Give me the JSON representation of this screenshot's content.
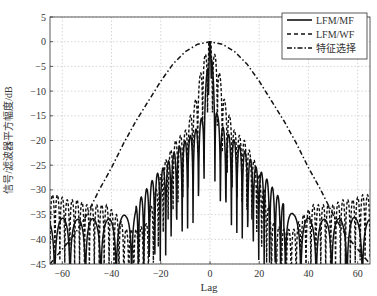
{
  "chart_data": {
    "type": "line",
    "title": "",
    "xlabel": "Lag",
    "ylabel": "信号/滤波器平方幅度/dB",
    "xlim": [
      -65,
      65
    ],
    "ylim": [
      -45,
      5
    ],
    "xticks": [
      -60,
      -40,
      -20,
      0,
      20,
      40,
      60
    ],
    "yticks": [
      5,
      0,
      -5,
      -10,
      -15,
      -20,
      -25,
      -30,
      -35,
      -40,
      -45
    ],
    "grid": true,
    "legend_position": "upper right",
    "series": [
      {
        "name": "LFM/MF",
        "style": "solid",
        "description": "Matched-filter output: 0 dB mainlobe at lag 0, near-in sidelobes about -13 to -20 dB, far sidelobes oscillating between about -35 and -45 dB",
        "x": [
          -62,
          -58,
          -54,
          -50,
          -46,
          -42,
          -38,
          -34,
          -30,
          -26,
          -22,
          -18,
          -14,
          -10,
          -6,
          -3,
          0,
          3,
          6,
          10,
          14,
          18,
          22,
          26,
          30,
          34,
          38,
          42,
          46,
          50,
          54,
          58,
          62
        ],
        "values": [
          -36,
          -35.5,
          -36,
          -35.5,
          -36,
          -36,
          -35.5,
          -35,
          -33,
          -30,
          -27,
          -25,
          -22,
          -20,
          -18,
          -15,
          0,
          -15,
          -18,
          -20,
          -22,
          -25,
          -27,
          -30,
          -33,
          -35,
          -35.5,
          -36,
          -36,
          -35.5,
          -36,
          -35.5,
          -36
        ]
      },
      {
        "name": "LFM/WF",
        "style": "dashed",
        "description": "Weighted-filter output: 0 dB peak at lag 0, dense sidelobes about -3 to -20 dB near center, far sidelobes about -30 to -38 dB",
        "x": [
          -62,
          -58,
          -54,
          -50,
          -46,
          -42,
          -38,
          -34,
          -30,
          -26,
          -22,
          -18,
          -14,
          -10,
          -6,
          -3,
          0,
          3,
          6,
          10,
          14,
          18,
          22,
          26,
          30,
          34,
          38,
          42,
          46,
          50,
          54,
          58,
          62
        ],
        "values": [
          -31,
          -32,
          -32,
          -33,
          -33,
          -33,
          -35,
          -38,
          -38,
          -37,
          -30,
          -24,
          -20,
          -18,
          -12,
          -4,
          0,
          -4,
          -12,
          -18,
          -20,
          -24,
          -30,
          -37,
          -38,
          -38,
          -35,
          -33,
          -33,
          -33,
          -32,
          -32,
          -31
        ]
      },
      {
        "name": "特征选择",
        "style": "dash-dot",
        "description": "Smooth parabolic envelope peaking at 0 dB at lag 0",
        "x": [
          -65,
          -60,
          -55,
          -50,
          -45,
          -40,
          -35,
          -30,
          -25,
          -20,
          -15,
          -10,
          -5,
          0,
          5,
          10,
          15,
          20,
          25,
          30,
          35,
          40,
          45,
          50,
          55,
          60,
          65
        ],
        "values": [
          -45,
          -42,
          -39,
          -35,
          -30,
          -25.5,
          -20.5,
          -16,
          -12,
          -8,
          -4.5,
          -2,
          -0.5,
          0,
          -0.5,
          -2,
          -4.5,
          -8,
          -12,
          -16,
          -20.5,
          -25.5,
          -30,
          -35,
          -39,
          -42,
          -45
        ]
      }
    ]
  },
  "legend": {
    "items": [
      {
        "label": "LFM/MF",
        "style": "solid"
      },
      {
        "label": "LFM/WF",
        "style": "dashed"
      },
      {
        "label": "特征选择",
        "style": "dash-dot"
      }
    ]
  },
  "axes": {
    "xlabel": "Lag",
    "ylabel": "信号/滤波器平方幅度/dB",
    "xtick_labels": [
      "-60",
      "-40",
      "-20",
      "0",
      "20",
      "40",
      "60"
    ],
    "ytick_labels": [
      "5",
      "0",
      "-5",
      "-10",
      "-15",
      "-20",
      "-25",
      "-30",
      "-35",
      "-40",
      "-45"
    ]
  },
  "colors": {
    "line": "#111111",
    "grid": "#bbbbbb",
    "axis": "#333333"
  }
}
